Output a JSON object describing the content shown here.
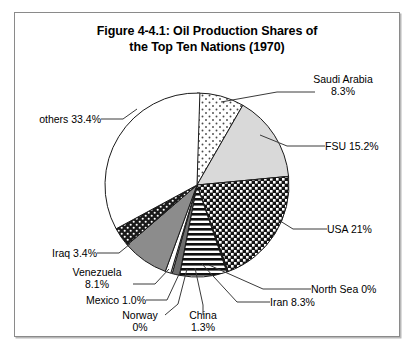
{
  "figure": {
    "title_line1": "Figure 4-4.1: Oil Production Shares of",
    "title_line2": "the Top Ten Nations (1970)"
  },
  "labels": {
    "saudi_arabia_l1": "Saudi Arabia",
    "saudi_arabia_l2": "8.3%",
    "fsu": "FSU 15.2%",
    "usa": "USA 21%",
    "north_sea": "North Sea 0%",
    "iran": "Iran 8.3%",
    "china_l1": "China",
    "china_l2": "1.3%",
    "norway_l1": "Norway",
    "norway_l2": "0%",
    "mexico": "Mexico 1.0%",
    "venezuela_l1": "Venezuela",
    "venezuela_l2": "8.1%",
    "iraq": "Iraq 3.4%",
    "others": "others 33.4%"
  },
  "chart_data": {
    "type": "pie",
    "title": "Figure 4-4.1: Oil Production Shares of the Top Ten Nations (1970)",
    "unit": "percent",
    "start_angle_deg": 0,
    "direction": "clockwise",
    "legend": "callout-labels",
    "categories": [
      "Saudi Arabia",
      "FSU",
      "USA",
      "North Sea",
      "Iran",
      "China",
      "Norway",
      "Mexico",
      "Venezuela",
      "Iraq",
      "others"
    ],
    "values": [
      8.3,
      15.2,
      21.0,
      0.0,
      8.3,
      1.3,
      0.0,
      1.0,
      8.1,
      3.4,
      33.4
    ],
    "slices": [
      {
        "name": "Saudi Arabia",
        "value": 8.3,
        "label": "Saudi Arabia 8.3%",
        "fill": "dots-light",
        "color": "#ffffff"
      },
      {
        "name": "FSU",
        "value": 15.2,
        "label": "FSU 15.2%",
        "fill": "solid",
        "color": "#d9d9d9"
      },
      {
        "name": "USA",
        "value": 21.0,
        "label": "USA 21%",
        "fill": "checker-dark",
        "color": "#1a1a1a"
      },
      {
        "name": "North Sea",
        "value": 0.0,
        "label": "North Sea 0%",
        "fill": "solid",
        "color": "#1a1a1a"
      },
      {
        "name": "Iran",
        "value": 8.3,
        "label": "Iran 8.3%",
        "fill": "hstripe",
        "color": "#ffffff"
      },
      {
        "name": "China",
        "value": 1.3,
        "label": "China 1.3%",
        "fill": "solid",
        "color": "#6e6e6e"
      },
      {
        "name": "Norway",
        "value": 0.0,
        "label": "Norway 0%",
        "fill": "solid",
        "color": "#ffffff"
      },
      {
        "name": "Mexico",
        "value": 1.0,
        "label": "Mexico 1.0%",
        "fill": "solid",
        "color": "#ffffff"
      },
      {
        "name": "Venezuela",
        "value": 8.1,
        "label": "Venezuela 8.1%",
        "fill": "solid",
        "color": "#8c8c8c"
      },
      {
        "name": "Iraq",
        "value": 3.4,
        "label": "Iraq 3.4%",
        "fill": "dots-dark",
        "color": "#1a1a1a"
      },
      {
        "name": "others",
        "value": 33.4,
        "label": "others 33.4%",
        "fill": "solid",
        "color": "#ffffff"
      }
    ]
  }
}
